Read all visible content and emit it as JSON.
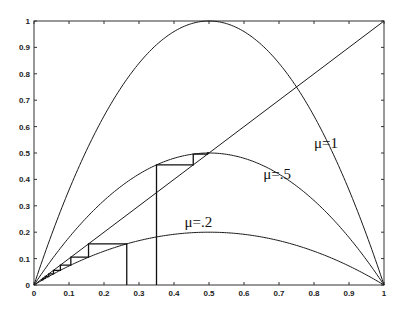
{
  "chart_data": {
    "type": "line",
    "title": "",
    "xlabel": "",
    "ylabel": "",
    "xlim": [
      0,
      1
    ],
    "ylim": [
      0,
      1
    ],
    "grid": false,
    "x_ticks": [
      "0",
      "0.1",
      "0.2",
      "0.3",
      "0.4",
      "0.5",
      "0.6",
      "0.7",
      "0.8",
      "0.9",
      "1"
    ],
    "y_ticks": [
      "0",
      "0.1",
      "0.2",
      "0.3",
      "0.4",
      "0.5",
      "0.6",
      "0.7",
      "0.8",
      "0.9",
      "1"
    ],
    "function": "f(x) = 4*mu*x*(1-x)",
    "series": [
      {
        "name": "μ=1",
        "mu": 1,
        "peak": [
          0.5,
          1.0
        ]
      },
      {
        "name": "μ=.5",
        "mu": 0.5,
        "peak": [
          0.5,
          0.5
        ]
      },
      {
        "name": "μ=.2",
        "mu": 0.2,
        "peak": [
          0.5,
          0.2
        ]
      },
      {
        "name": "diagonal",
        "x": [
          0,
          1
        ],
        "y": [
          0,
          1
        ]
      }
    ],
    "cobwebs": [
      {
        "mu": 0.5,
        "x0": 0.35,
        "iterations": 3
      },
      {
        "mu": 0.2,
        "x0": 0.265,
        "iterations": 8
      }
    ],
    "annotations": [
      {
        "text": "μ=1",
        "x": 0.8,
        "y": 0.52
      },
      {
        "text": "μ=.5",
        "x": 0.655,
        "y": 0.4
      },
      {
        "text": "μ=.2",
        "x": 0.43,
        "y": 0.22
      }
    ]
  }
}
